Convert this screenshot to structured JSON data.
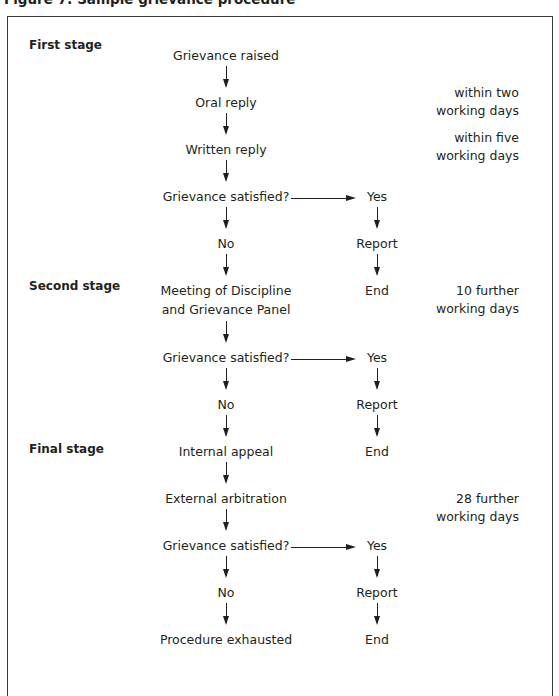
{
  "figure": {
    "title": "Figure 7: Sample grievance procedure"
  },
  "stages": [
    {
      "label": "First stage"
    },
    {
      "label": "Second stage"
    },
    {
      "label": "Final stage"
    }
  ],
  "main_column": [
    "Grievance raised",
    "Oral reply",
    "Written reply",
    "Grievance satisfied?",
    "No",
    "Meeting of Discipline",
    "and Grievance Panel",
    "Grievance satisfied?",
    "No",
    "Internal appeal",
    "External arbitration",
    "Grievance satisfied?",
    "No",
    "Procedure exhausted"
  ],
  "yes_branches": [
    {
      "yes": "Yes",
      "report": "Report",
      "end": "End"
    },
    {
      "yes": "Yes",
      "report": "Report",
      "end": "End"
    },
    {
      "yes": "Yes",
      "report": "Report",
      "end": "End"
    }
  ],
  "time_notes": [
    {
      "line1": "within two",
      "line2": "working days"
    },
    {
      "line1": "within five",
      "line2": "working days"
    },
    {
      "line1": "10 further",
      "line2": "working days"
    },
    {
      "line1": "28 further",
      "line2": "working days"
    }
  ],
  "colors": {
    "text": "#231f20",
    "border": "#3a3a3a",
    "background": "#ffffff"
  }
}
